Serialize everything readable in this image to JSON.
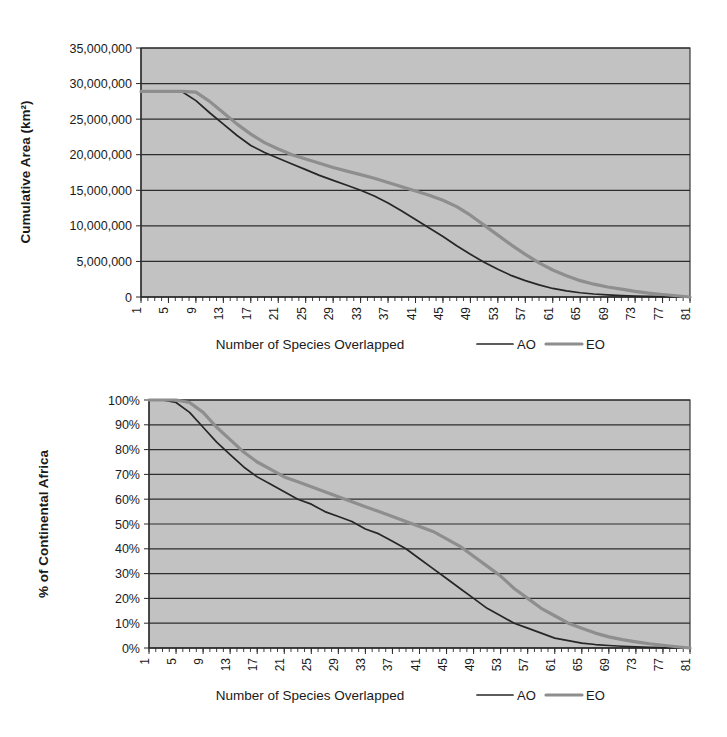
{
  "figure": {
    "background_color": "#ffffff",
    "plot_background_color": "#c2c2c2",
    "gridline_color": "#2d2d2d",
    "series_colors": {
      "AO": "#262626",
      "EO": "#8e8e8e"
    }
  },
  "chart_data": [
    {
      "id": "top",
      "type": "line",
      "title": "",
      "xlabel": "Number of Species Overlapped",
      "ylabel": "Cumulative Area (km²)",
      "xlim": [
        1,
        81
      ],
      "ylim": [
        0,
        35000000
      ],
      "ytick_labels": [
        "0",
        "5,000,000",
        "10,000,000",
        "15,000,000",
        "20,000,000",
        "25,000,000",
        "30,000,000",
        "35,000,000"
      ],
      "ytick_values": [
        0,
        5000000,
        10000000,
        15000000,
        20000000,
        25000000,
        30000000,
        35000000
      ],
      "xtick_labels": [
        "1",
        "5",
        "9",
        "13",
        "17",
        "21",
        "25",
        "29",
        "33",
        "37",
        "41",
        "45",
        "49",
        "53",
        "57",
        "61",
        "65",
        "69",
        "73",
        "77",
        "81"
      ],
      "xtick_values": [
        1,
        5,
        9,
        13,
        17,
        21,
        25,
        29,
        33,
        37,
        41,
        45,
        49,
        53,
        57,
        61,
        65,
        69,
        73,
        77,
        81
      ],
      "grid": true,
      "legend_position": "below-right",
      "x": [
        1,
        3,
        5,
        7,
        9,
        11,
        13,
        15,
        17,
        19,
        21,
        23,
        25,
        27,
        29,
        31,
        33,
        35,
        37,
        39,
        41,
        43,
        45,
        47,
        49,
        51,
        53,
        55,
        57,
        59,
        61,
        63,
        65,
        67,
        69,
        71,
        73,
        75,
        77,
        79,
        81
      ],
      "series": [
        {
          "name": "AO",
          "label": "AO",
          "values": [
            28900000,
            28900000,
            28900000,
            28850000,
            27600000,
            25900000,
            24300000,
            22700000,
            21300000,
            20300000,
            19500000,
            18700000,
            17900000,
            17100000,
            16400000,
            15700000,
            15000000,
            14200000,
            13200000,
            12100000,
            10900000,
            9700000,
            8500000,
            7200000,
            6000000,
            4900000,
            3900000,
            3000000,
            2300000,
            1700000,
            1200000,
            850000,
            600000,
            420000,
            290000,
            200000,
            130000,
            85000,
            50000,
            25000,
            0
          ]
        },
        {
          "name": "EO",
          "label": "EO",
          "values": [
            28900000,
            28900000,
            28900000,
            28900000,
            28800000,
            27500000,
            25900000,
            24300000,
            22900000,
            21700000,
            20800000,
            20000000,
            19400000,
            18800000,
            18200000,
            17700000,
            17200000,
            16700000,
            16100000,
            15500000,
            14900000,
            14300000,
            13600000,
            12700000,
            11500000,
            10100000,
            8700000,
            7300000,
            6000000,
            4800000,
            3800000,
            3000000,
            2300000,
            1800000,
            1400000,
            1100000,
            800000,
            550000,
            350000,
            180000,
            0
          ]
        }
      ]
    },
    {
      "id": "bottom",
      "type": "line",
      "title": "",
      "xlabel": "Number of Species Overlapped",
      "ylabel": "% of Continental Africa",
      "xlim": [
        1,
        81
      ],
      "ylim": [
        0,
        100
      ],
      "ytick_labels": [
        "0%",
        "10%",
        "20%",
        "30%",
        "40%",
        "50%",
        "60%",
        "70%",
        "80%",
        "90%",
        "100%"
      ],
      "ytick_values": [
        0,
        10,
        20,
        30,
        40,
        50,
        60,
        70,
        80,
        90,
        100
      ],
      "xtick_labels": [
        "1",
        "5",
        "9",
        "13",
        "17",
        "21",
        "25",
        "29",
        "33",
        "37",
        "41",
        "45",
        "49",
        "53",
        "57",
        "61",
        "65",
        "69",
        "73",
        "77",
        "81"
      ],
      "xtick_values": [
        1,
        5,
        9,
        13,
        17,
        21,
        25,
        29,
        33,
        37,
        41,
        45,
        49,
        53,
        57,
        61,
        65,
        69,
        73,
        77,
        81
      ],
      "grid": true,
      "legend_position": "below-right",
      "x": [
        1,
        3,
        5,
        7,
        9,
        11,
        13,
        15,
        17,
        19,
        21,
        23,
        25,
        27,
        29,
        31,
        33,
        35,
        37,
        39,
        41,
        43,
        45,
        47,
        49,
        51,
        53,
        55,
        57,
        59,
        61,
        63,
        65,
        67,
        69,
        71,
        73,
        75,
        77,
        79,
        81
      ],
      "series": [
        {
          "name": "AO",
          "label": "AO",
          "values": [
            100,
            100,
            99,
            95,
            89,
            83,
            78,
            73,
            69,
            66,
            63,
            60,
            58,
            55,
            53,
            51,
            48,
            46,
            43,
            40,
            36,
            32,
            28,
            24,
            20,
            16,
            13,
            10,
            8,
            6,
            4,
            3,
            2,
            1.4,
            1,
            0.7,
            0.45,
            0.3,
            0.18,
            0.08,
            0
          ]
        },
        {
          "name": "EO",
          "label": "EO",
          "values": [
            100,
            100,
            100,
            99,
            95,
            89,
            84,
            79,
            75,
            72,
            69,
            67,
            65,
            63,
            61,
            59,
            57,
            55,
            53,
            51,
            49,
            47,
            44,
            41,
            37,
            33,
            29,
            24,
            20,
            16,
            13,
            10,
            8,
            6,
            4.5,
            3.4,
            2.5,
            1.7,
            1.1,
            0.5,
            0
          ]
        }
      ]
    }
  ]
}
